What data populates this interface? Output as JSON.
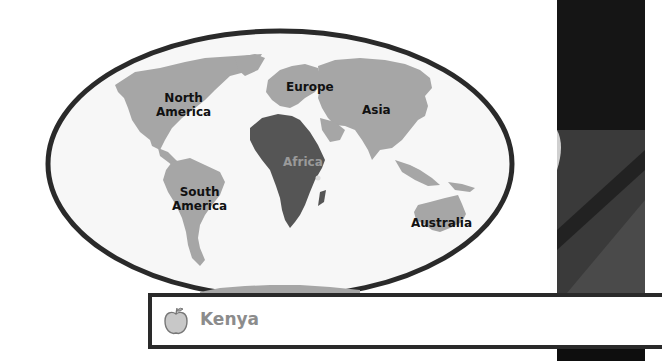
{
  "map": {
    "continents": [
      {
        "name": "North America",
        "line1": "North",
        "line2": "America",
        "color": "#a6a6a6"
      },
      {
        "name": "Europe",
        "color": "#a6a6a6"
      },
      {
        "name": "Asia",
        "color": "#a6a6a6"
      },
      {
        "name": "Africa",
        "color": "#555555",
        "highlighted": true
      },
      {
        "name": "South America",
        "line1": "South",
        "line2": "America",
        "color": "#a6a6a6"
      },
      {
        "name": "Australia",
        "color": "#a6a6a6"
      }
    ],
    "labels": {
      "north_america_1": "North",
      "north_america_2": "America",
      "europe": "Europe",
      "asia": "Asia",
      "africa": "Africa",
      "south_america_1": "South",
      "south_america_2": "America",
      "australia": "Australia"
    },
    "outline_color": "#2a2a2a",
    "ocean_color": "#f6f6f6",
    "land_color": "#a6a6a6",
    "highlight_color": "#555555"
  },
  "info_box": {
    "icon": "apple-icon",
    "country": "Kenya"
  }
}
